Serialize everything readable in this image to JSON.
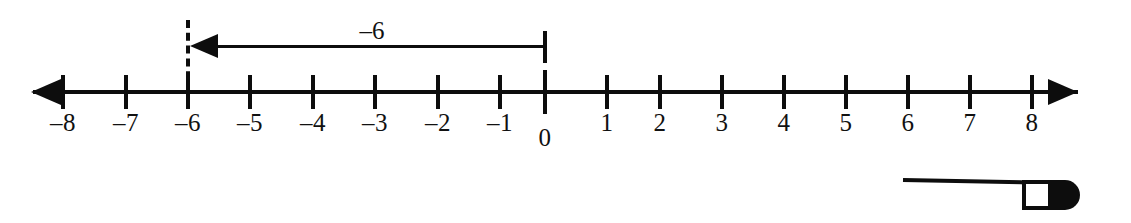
{
  "figure": {
    "type": "number-line",
    "background_color": "#ffffff",
    "ink_color": "#0d0d0d"
  },
  "number_line": {
    "axis": {
      "left_arrow": "left-arrowhead",
      "right_arrow": "right-arrowhead",
      "min_label": "-8",
      "max_label": "8"
    },
    "ticks": [
      {
        "value": -8,
        "label": "–8",
        "x": 63
      },
      {
        "value": -7,
        "label": "–7",
        "x": 126
      },
      {
        "value": -6,
        "label": "–6",
        "x": 188
      },
      {
        "value": -5,
        "label": "–5",
        "x": 250
      },
      {
        "value": -4,
        "label": "–4",
        "x": 313
      },
      {
        "value": -3,
        "label": "–3",
        "x": 375
      },
      {
        "value": -2,
        "label": "–2",
        "x": 438
      },
      {
        "value": -1,
        "label": "–1",
        "x": 500
      },
      {
        "value": 0,
        "label": "0",
        "x": 545
      },
      {
        "value": 1,
        "label": "1",
        "x": 607
      },
      {
        "value": 2,
        "label": "2",
        "x": 660
      },
      {
        "value": 3,
        "label": "3",
        "x": 722
      },
      {
        "value": 4,
        "label": "4",
        "x": 784
      },
      {
        "value": 5,
        "label": "5",
        "x": 846
      },
      {
        "value": 6,
        "label": "6",
        "x": 908
      },
      {
        "value": 7,
        "label": "7",
        "x": 970
      },
      {
        "value": 8,
        "label": "8",
        "x": 1032
      }
    ]
  },
  "jump_arrow": {
    "label": "–6",
    "from_value": 0,
    "to_value": -6,
    "direction": "left",
    "start_x": 545,
    "end_x": 188
  },
  "guide_line": {
    "at_value": -6,
    "style": "dashed"
  },
  "annotations": {
    "pointer_mark": "page-edge-pointer-mark"
  },
  "chart_data": {
    "type": "line",
    "xlabel": "",
    "ylabel": "",
    "xlim": [
      -8,
      8
    ],
    "categories": [
      "–8",
      "–7",
      "–6",
      "–5",
      "–4",
      "–3",
      "–2",
      "–1",
      "0",
      "1",
      "2",
      "3",
      "4",
      "5",
      "6",
      "7",
      "8"
    ],
    "values": [
      -8,
      -7,
      -6,
      -5,
      -4,
      -3,
      -2,
      -1,
      0,
      1,
      2,
      3,
      4,
      5,
      6,
      7,
      8
    ],
    "annotations": [
      {
        "text": "–6",
        "from": 0,
        "to": -6,
        "kind": "arrow"
      }
    ],
    "grid": false,
    "legend": "none"
  }
}
